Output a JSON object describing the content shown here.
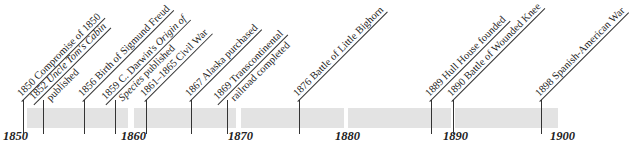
{
  "timeline": {
    "axis_labels": [
      "1850",
      "1860",
      "1870",
      "1880",
      "1890",
      "1900"
    ],
    "colors": {
      "bar": "#e3e3e3",
      "line": "#333333",
      "text": "#222222"
    },
    "events": [
      {
        "year": "1850",
        "text": "1850 Compromise of 1850",
        "line2": ""
      },
      {
        "year": "1852",
        "text_pre": "1852 ",
        "text_italic": "Uncle Tom's Cabin",
        "line2": "published"
      },
      {
        "year": "1856",
        "text": "1856 Birth of Sigmund Freud",
        "line2": ""
      },
      {
        "year": "1859",
        "text_pre": "1859 C. Darwin's ",
        "text_italic": "Origin of",
        "line2_italic": "Species",
        "line2": " published"
      },
      {
        "year": "1861",
        "text": "1861–1865 Civil War",
        "line2": ""
      },
      {
        "year": "1867",
        "text": "1867 Alaska purchased",
        "line2": ""
      },
      {
        "year": "1869",
        "text": "1869 Transcontinental",
        "line2": "railroad completed"
      },
      {
        "year": "1876",
        "text": "1876 Battle of Little Bighorn",
        "line2": ""
      },
      {
        "year": "1889",
        "text": "1889 Hull House founded",
        "line2": ""
      },
      {
        "year": "1890",
        "text": "1890 Battle of Wounded Knee",
        "line2": ""
      },
      {
        "year": "1898",
        "text": "1898 Spanish-American War",
        "line2": ""
      }
    ]
  }
}
